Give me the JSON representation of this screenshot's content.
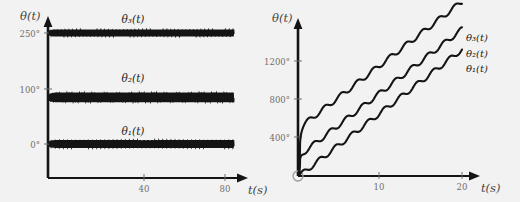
{
  "figure": {
    "background_color": "#f2f2f2",
    "line_color": "#141414",
    "tick_text_color": "#6e6e6e",
    "axis_label_color": "#444444"
  },
  "chart_data": [
    {
      "id": "left-chart",
      "type": "line",
      "title": "",
      "xlabel": "t(s)",
      "ylabel": "θ(t)",
      "xlim": [
        0,
        84
      ],
      "ylim": [
        -40,
        290
      ],
      "grid": false,
      "legend_position": "inline-above-curve",
      "xticks": [
        40,
        80
      ],
      "xticklabels": [
        "40",
        "80"
      ],
      "yticks": [
        0,
        100,
        250
      ],
      "yticklabels": [
        "0°",
        "100°",
        "250°"
      ],
      "annotations": [
        "θ₃(t)",
        "θ₂(t)",
        "θ₁(t)"
      ],
      "description": "Three high-frequency oscillating signals settled about constant offsets",
      "series": [
        {
          "name": "θ₁(t)",
          "label": "θ₁(t)",
          "offset": 0,
          "amplitude": 9,
          "frequency": 2.15,
          "label_x": 40,
          "label_y": 36,
          "color": "#141414"
        },
        {
          "name": "θ₂(t)",
          "label": "θ₂(t)",
          "offset": 105,
          "amplitude": 11,
          "frequency": 1.95,
          "label_x": 40,
          "label_y": 140,
          "color": "#141414"
        },
        {
          "name": "θ₃(t)",
          "label": "θ₃(t)",
          "offset": 250,
          "amplitude": 8,
          "frequency": 2.3,
          "label_x": 40,
          "label_y": 282,
          "color": "#141414"
        }
      ]
    },
    {
      "id": "right-chart",
      "type": "line",
      "title": "",
      "xlabel": "t(s)",
      "ylabel": "θ(t)",
      "xlim": [
        0,
        21
      ],
      "ylim": [
        0,
        1560
      ],
      "grid": false,
      "legend_position": "right-of-curve-ends",
      "xticks": [
        10,
        20
      ],
      "xticklabels": [
        "10",
        "20"
      ],
      "yticks": [
        400,
        800,
        1200
      ],
      "yticklabels": [
        "400°",
        "800°",
        "1200°"
      ],
      "annotations": [
        "θ₃(t)",
        "θ₂(t)",
        "θ₁(t)"
      ],
      "description": "Three monotonically increasing, slightly wavy ramps with constant vertical offsets",
      "origin_marker": "open-circle",
      "series": [
        {
          "name": "θ₁(t)",
          "label": "θ₁(t)",
          "intercept": 0,
          "slope": 66,
          "ripple": 26,
          "ripple_freq": 2.0,
          "x_end": 20,
          "y_end": 1320,
          "color": "#141414"
        },
        {
          "name": "θ₂(t)",
          "label": "θ₂(t)",
          "intercept": 105,
          "slope": 66,
          "ripple": 26,
          "ripple_freq": 2.0,
          "x_end": 20,
          "y_end": 1425,
          "color": "#141414"
        },
        {
          "name": "θ₃(t)",
          "label": "θ₃(t)",
          "intercept": 250,
          "slope": 66,
          "ripple": 26,
          "ripple_freq": 2.0,
          "x_end": 20,
          "y_end": 1570,
          "color": "#141414"
        }
      ]
    }
  ],
  "left_chart": {
    "y_axis_title": "θ(t)",
    "x_axis_title": "t(s)",
    "ytick_0": "0°",
    "ytick_1": "100°",
    "ytick_2": "250°",
    "xtick_0": "40",
    "xtick_1": "80",
    "curve_label_1": "θ₁(t)",
    "curve_label_2": "θ₂(t)",
    "curve_label_3": "θ₃(t)"
  },
  "right_chart": {
    "y_axis_title": "θ(t)",
    "x_axis_title": "t(s)",
    "ytick_0": "400°",
    "ytick_1": "800°",
    "ytick_2": "1200°",
    "xtick_0": "10",
    "xtick_1": "20",
    "curve_label_1": "θ₁(t)",
    "curve_label_2": "θ₂(t)",
    "curve_label_3": "θ₃(t)"
  }
}
